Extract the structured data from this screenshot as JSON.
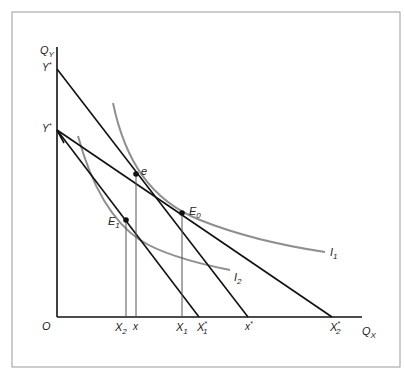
{
  "figure": {
    "frame_color": "#9a9a9a",
    "line_color": "#111111",
    "curve_color": "#8f8f8f",
    "axes": {
      "y_label": "Q",
      "y_label_sub": "Y",
      "x_label": "Q",
      "x_label_sub": "X",
      "origin_label": "O"
    },
    "y_ticks": [
      {
        "label": "Y",
        "sup": "*",
        "y": 69
      },
      {
        "label": "Y",
        "sup": "*",
        "y": 130
      }
    ],
    "x_ticks": [
      {
        "label": "X",
        "sub": "2",
        "x": 125
      },
      {
        "label": "x",
        "sub": "",
        "x": 135
      },
      {
        "label": "X",
        "sub": "1",
        "x": 181
      },
      {
        "label": "X",
        "sub": "1",
        "sup": "*",
        "x": 199
      },
      {
        "label": "x",
        "sup": "*",
        "x": 248
      },
      {
        "label": "X",
        "sub": "2",
        "sup": "*",
        "x": 332
      }
    ],
    "points": [
      {
        "label": "e",
        "x": 136,
        "y": 174
      },
      {
        "label": "E",
        "sub": "0",
        "x": 182,
        "y": 213
      },
      {
        "label": "E",
        "sub": "1",
        "x": 126,
        "y": 220
      }
    ],
    "curves": [
      {
        "label": "I",
        "sub": "1"
      },
      {
        "label": "I",
        "sub": "2"
      }
    ]
  }
}
